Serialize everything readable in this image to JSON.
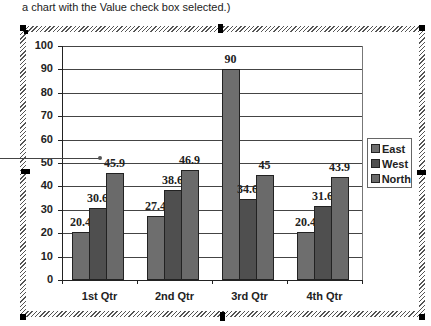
{
  "caption": "a chart with the Value check box selected.)",
  "colors": {
    "east": "#6e6e6e",
    "west": "#4f4f4f",
    "north": "#6a6a6a",
    "grid": "#444444",
    "frame_hatch": "#555555"
  },
  "chart_data": {
    "type": "bar",
    "title": "",
    "xlabel": "",
    "ylabel": "",
    "categories": [
      "1st Qtr",
      "2nd Qtr",
      "3rd Qtr",
      "4th Qtr"
    ],
    "series": [
      {
        "name": "East",
        "values": [
          20.4,
          27.4,
          90,
          20.4
        ]
      },
      {
        "name": "West",
        "values": [
          30.6,
          38.6,
          34.6,
          31.6
        ]
      },
      {
        "name": "North",
        "values": [
          45.9,
          46.9,
          45,
          43.9
        ]
      }
    ],
    "data_labels": {
      "east": [
        "20.4",
        "27.4",
        "90",
        "20.4"
      ],
      "west": [
        "30.6",
        "38.6",
        "34.6",
        "31.6"
      ],
      "north": [
        "45.9",
        "46.9",
        "45",
        "43.9"
      ]
    },
    "ylim": [
      0,
      100
    ],
    "yticks": [
      "0",
      "10",
      "20",
      "30",
      "40",
      "50",
      "60",
      "70",
      "80",
      "90",
      "100"
    ],
    "grid": true,
    "legend_position": "right",
    "legend": [
      "East",
      "West",
      "North"
    ]
  }
}
